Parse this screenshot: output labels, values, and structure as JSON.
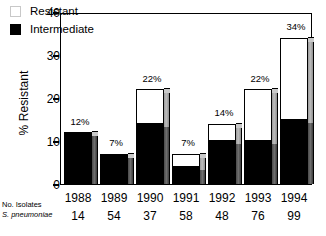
{
  "chart_data": {
    "type": "bar",
    "subtype": "stacked-bar",
    "title": "",
    "xlabel": "",
    "ylabel": "% Resistant",
    "ylim": [
      0,
      40
    ],
    "yticks": [
      0,
      10,
      20,
      30,
      40
    ],
    "grid": false,
    "legend_position": "top-left",
    "categories": [
      "1988",
      "1989",
      "1990",
      "1991",
      "1992",
      "1993",
      "1994"
    ],
    "series": [
      {
        "name": "Intermediate",
        "color": "#000000",
        "values": [
          12,
          7,
          14,
          4,
          10,
          10,
          15
        ]
      },
      {
        "name": "Resistant",
        "color": "#ffffff",
        "values": [
          0,
          0,
          8,
          3,
          4,
          12,
          19
        ]
      }
    ],
    "bar_labels": [
      "12%",
      "7%",
      "22%",
      "7%",
      "14%",
      "22%",
      "34%"
    ],
    "totals": [
      12,
      7,
      22,
      7,
      14,
      22,
      34
    ],
    "annotations": {
      "row_label_line1": "No. Isolates",
      "row_label_line2": "S. pneumoniae",
      "row_values": [
        "14",
        "54",
        "37",
        "58",
        "48",
        "76",
        "99"
      ]
    }
  },
  "legend": {
    "items": [
      {
        "label": "Resistant",
        "swatch": "open-square-icon"
      },
      {
        "label": "Intermediate",
        "swatch": "filled-square-icon"
      }
    ]
  },
  "axis": {
    "y_title": "% Resistant",
    "y_ticks": [
      "40",
      "30",
      "20",
      "10",
      "0"
    ]
  }
}
